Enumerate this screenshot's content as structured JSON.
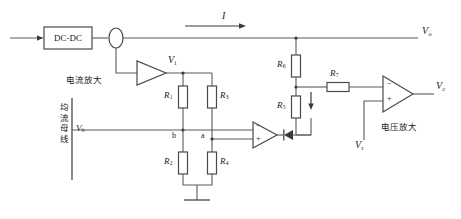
{
  "diagram": {
    "type": "electronic-schematic",
    "colors": {
      "wire": "#5a5a5a",
      "component_stroke": "#4a4a4a",
      "text": "#1a1a1a",
      "background": "#ffffff"
    }
  },
  "blocks": {
    "converter_label": "DC-DC",
    "current_sensor_name": "current-sensor"
  },
  "labels": {
    "current_I": "I",
    "output_Vo": "V",
    "output_Vo_sub": "o",
    "amp_out_Vi": "V",
    "amp_out_Vi_sub": "i",
    "bus_Vb": "V",
    "bus_Vb_sub": "b",
    "ref_Vr": "V",
    "ref_Vr_sub": "r",
    "ctrl_Vc": "V",
    "ctrl_Vc_sub": "c",
    "node_a": "a",
    "node_b": "b",
    "current_amp_cn": "电流放大",
    "voltage_amp_cn": "电压放大",
    "bus_cn": "均流母线"
  },
  "resistors": [
    {
      "id": "R1",
      "name": "R",
      "sub": "1",
      "orientation": "vertical"
    },
    {
      "id": "R2",
      "name": "R",
      "sub": "2",
      "orientation": "vertical"
    },
    {
      "id": "R3",
      "name": "R",
      "sub": "3",
      "orientation": "vertical"
    },
    {
      "id": "R4",
      "name": "R",
      "sub": "4",
      "orientation": "vertical"
    },
    {
      "id": "R5",
      "name": "R",
      "sub": "5",
      "orientation": "vertical"
    },
    {
      "id": "R6",
      "name": "R",
      "sub": "6",
      "orientation": "vertical"
    },
    {
      "id": "R7",
      "name": "R",
      "sub": "7",
      "orientation": "horizontal"
    }
  ],
  "opamps": {
    "current_amp": {
      "name": "current-amplifier",
      "inputs": []
    },
    "comparator": {
      "name": "comparator-opamp",
      "minus": "−",
      "plus": "+"
    },
    "voltage_amp": {
      "name": "voltage-amplifier",
      "minus": "−",
      "plus": "+"
    }
  },
  "symbols": {
    "diode": "diode",
    "ground": "ground",
    "arrow_current": "current-direction-arrow",
    "arrow_R5": "r5-current-arrow"
  }
}
